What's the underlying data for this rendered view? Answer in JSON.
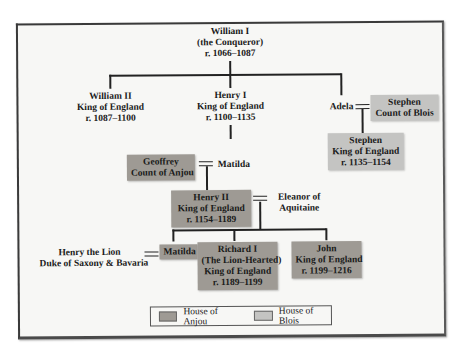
{
  "diagram": {
    "type": "family-tree",
    "colors": {
      "house_of_anjou": "#9e9a94",
      "house_of_blois": "#c4c4c2",
      "line": "#222222"
    },
    "nodes": {
      "william_i": {
        "name": "William I",
        "title": "(the Conqueror)",
        "reign": "r. 1066–1087",
        "house": "none"
      },
      "william_ii": {
        "name": "William II",
        "title": "King of England",
        "reign": "r. 1087–1100",
        "house": "none"
      },
      "henry_i": {
        "name": "Henry I",
        "title": "King of England",
        "reign": "r. 1100–1135",
        "house": "none"
      },
      "adela": {
        "name": "Adela",
        "house": "none"
      },
      "stephen_blois": {
        "name": "Stephen",
        "title": "Count of Blois",
        "house": "blois"
      },
      "stephen_king": {
        "name": "Stephen",
        "title": "King of England",
        "reign": "r. 1135–1154",
        "house": "blois"
      },
      "geoffrey": {
        "name": "Geoffrey",
        "title": "Count of Anjou",
        "house": "anjou"
      },
      "matilda_empress": {
        "name": "Matilda",
        "house": "none"
      },
      "henry_ii": {
        "name": "Henry II",
        "title": "King of England",
        "reign": "r. 1154–1189",
        "house": "anjou"
      },
      "eleanor": {
        "name": "Eleanor of",
        "title": "Aquitaine",
        "house": "none"
      },
      "henry_lion": {
        "name": "Henry the Lion",
        "title": "Duke of Saxony & Bavaria",
        "house": "none"
      },
      "matilda_daughter": {
        "name": "Matilda",
        "house": "anjou"
      },
      "richard_i": {
        "name": "Richard I",
        "epithet": "(The Lion-Hearted)",
        "title": "King of England",
        "reign": "r. 1189–1199",
        "house": "anjou"
      },
      "john": {
        "name": "John",
        "title": "King of England",
        "reign": "r. 1199–1216",
        "house": "anjou"
      }
    },
    "legend": {
      "anjou_label": "House of Anjou",
      "blois_label": "House of Blois"
    }
  }
}
